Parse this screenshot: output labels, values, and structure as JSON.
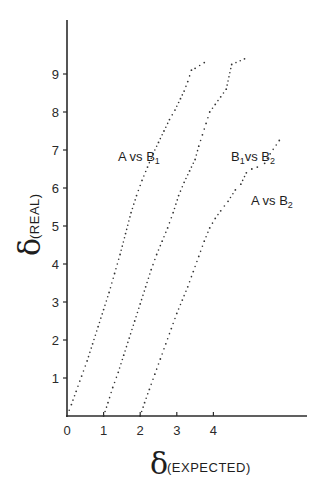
{
  "chart_data": {
    "type": "scatter",
    "title": "",
    "xlabel": {
      "symbol": "δ",
      "subscript": "(EXPECTED)"
    },
    "ylabel": {
      "symbol": "δ",
      "subscript": "(REAL)"
    },
    "xlim": [
      0,
      6.5
    ],
    "ylim": [
      0,
      10
    ],
    "x_ticks": [
      0,
      1,
      2,
      3,
      4
    ],
    "y_ticks": [
      1,
      2,
      3,
      4,
      5,
      6,
      7,
      8,
      9
    ],
    "x_tick_labels": [
      "0",
      "1",
      "2",
      "3",
      "4"
    ],
    "y_tick_labels": [
      "1",
      "2",
      "3",
      "4",
      "5",
      "6",
      "7",
      "8",
      "9"
    ],
    "grid": false,
    "legend": "none (inline labels)",
    "series": [
      {
        "name": "A vs B1",
        "label_main": "A vs B",
        "label_sub": "1",
        "points": [
          [
            0.0,
            0.0
          ],
          [
            0.12,
            0.3
          ],
          [
            0.25,
            0.65
          ],
          [
            0.4,
            1.05
          ],
          [
            0.55,
            1.45
          ],
          [
            0.7,
            1.9
          ],
          [
            0.85,
            2.35
          ],
          [
            1.0,
            2.8
          ],
          [
            1.15,
            3.25
          ],
          [
            1.3,
            3.75
          ],
          [
            1.45,
            4.25
          ],
          [
            1.6,
            4.8
          ],
          [
            1.75,
            5.35
          ],
          [
            1.9,
            5.8
          ],
          [
            2.05,
            6.2
          ],
          [
            2.2,
            6.55
          ],
          [
            2.35,
            6.9
          ],
          [
            2.5,
            7.2
          ],
          [
            2.65,
            7.5
          ],
          [
            2.8,
            7.8
          ],
          [
            2.95,
            8.05
          ],
          [
            3.1,
            8.35
          ],
          [
            3.2,
            8.55
          ],
          [
            3.3,
            8.8
          ],
          [
            3.4,
            9.1
          ],
          [
            3.5,
            9.15
          ],
          [
            3.75,
            9.3
          ]
        ]
      },
      {
        "name": "B1 vs B2",
        "label_main": "B",
        "label_mid": "1",
        "label_rest": "vs B",
        "label_sub": "2",
        "points": [
          [
            1.0,
            0.0
          ],
          [
            1.12,
            0.35
          ],
          [
            1.25,
            0.75
          ],
          [
            1.4,
            1.15
          ],
          [
            1.55,
            1.6
          ],
          [
            1.7,
            2.05
          ],
          [
            1.85,
            2.5
          ],
          [
            2.0,
            2.95
          ],
          [
            2.15,
            3.4
          ],
          [
            2.3,
            3.85
          ],
          [
            2.45,
            4.25
          ],
          [
            2.6,
            4.6
          ],
          [
            2.75,
            4.95
          ],
          [
            2.9,
            5.35
          ],
          [
            3.05,
            5.8
          ],
          [
            3.2,
            6.15
          ],
          [
            3.35,
            6.45
          ],
          [
            3.5,
            6.75
          ],
          [
            3.6,
            7.1
          ],
          [
            3.7,
            7.4
          ],
          [
            3.8,
            7.7
          ],
          [
            3.9,
            8.0
          ],
          [
            4.05,
            8.2
          ],
          [
            4.2,
            8.4
          ],
          [
            4.35,
            8.6
          ],
          [
            4.5,
            9.25
          ],
          [
            4.85,
            9.4
          ]
        ]
      },
      {
        "name": "A vs B2",
        "label_main": "A vs B",
        "label_sub": "2",
        "points": [
          [
            2.0,
            0.0
          ],
          [
            2.12,
            0.35
          ],
          [
            2.25,
            0.7
          ],
          [
            2.4,
            1.1
          ],
          [
            2.55,
            1.5
          ],
          [
            2.7,
            1.9
          ],
          [
            2.85,
            2.3
          ],
          [
            3.0,
            2.7
          ],
          [
            3.15,
            3.05
          ],
          [
            3.3,
            3.4
          ],
          [
            3.45,
            3.8
          ],
          [
            3.6,
            4.2
          ],
          [
            3.75,
            4.6
          ],
          [
            3.9,
            4.95
          ],
          [
            4.05,
            5.2
          ],
          [
            4.2,
            5.4
          ],
          [
            4.4,
            5.65
          ],
          [
            4.6,
            5.95
          ],
          [
            4.75,
            6.1
          ],
          [
            4.9,
            6.4
          ],
          [
            5.05,
            6.5
          ],
          [
            5.2,
            6.55
          ],
          [
            5.4,
            6.65
          ],
          [
            5.55,
            6.9
          ],
          [
            5.8,
            7.25
          ]
        ]
      }
    ]
  }
}
